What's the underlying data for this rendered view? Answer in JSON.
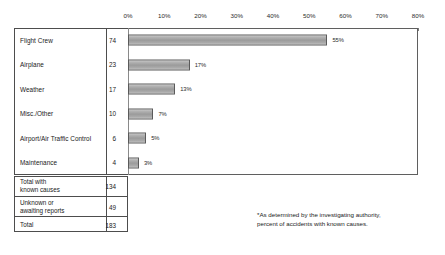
{
  "chart_data": {
    "type": "bar",
    "orientation": "horizontal",
    "title": "",
    "xlabel": "",
    "ylabel": "",
    "xlim": [
      0,
      80
    ],
    "grid": false,
    "legend": null,
    "axis_ticks": [
      "0%",
      "10%",
      "20%",
      "30%",
      "40%",
      "50%",
      "60%",
      "70%",
      "80%"
    ],
    "axis_tick_values": [
      0,
      10,
      20,
      30,
      40,
      50,
      60,
      70,
      80
    ],
    "categories": [
      "Flight Crew",
      "Airplane",
      "Weather",
      "Misc./Other",
      "Airport/Air Traffic Control",
      "Maintenance"
    ],
    "counts": [
      74,
      23,
      17,
      10,
      6,
      4
    ],
    "values": [
      55,
      17,
      13,
      7,
      5,
      3
    ],
    "value_labels": [
      "55%",
      "17%",
      "13%",
      "7%",
      "5%",
      "3%"
    ],
    "bars": [
      {
        "category": "Flight Crew",
        "count": 74,
        "percent": 55,
        "percent_label": "55%"
      },
      {
        "category": "Airplane",
        "count": 23,
        "percent": 17,
        "percent_label": "17%"
      },
      {
        "category": "Weather",
        "count": 17,
        "percent": 13,
        "percent_label": "13%"
      },
      {
        "category": "Misc./Other",
        "count": 10,
        "percent": 7,
        "percent_label": "7%"
      },
      {
        "category": "Airport/Air Traffic Control",
        "count": 6,
        "percent": 5,
        "percent_label": "5%"
      },
      {
        "category": "Maintenance",
        "count": 4,
        "percent": 3,
        "percent_label": "3%"
      }
    ],
    "summary": [
      {
        "label": "Total with\nknown causes",
        "count": 134
      },
      {
        "label": "Unknown or\nawaiting reports",
        "count": 49
      },
      {
        "label": "Total",
        "count": 183
      }
    ],
    "footnote": [
      "*As determined by the investigating authority,",
      "percent of accidents with known causes."
    ],
    "colors": {
      "bar_fill": "#a5a5a5",
      "bar_border": "#5a5a5a",
      "frame": "#5f5f5f",
      "table_border": "#4d4d4d",
      "text": "#1a1a1a",
      "background": "#ffffff"
    }
  }
}
